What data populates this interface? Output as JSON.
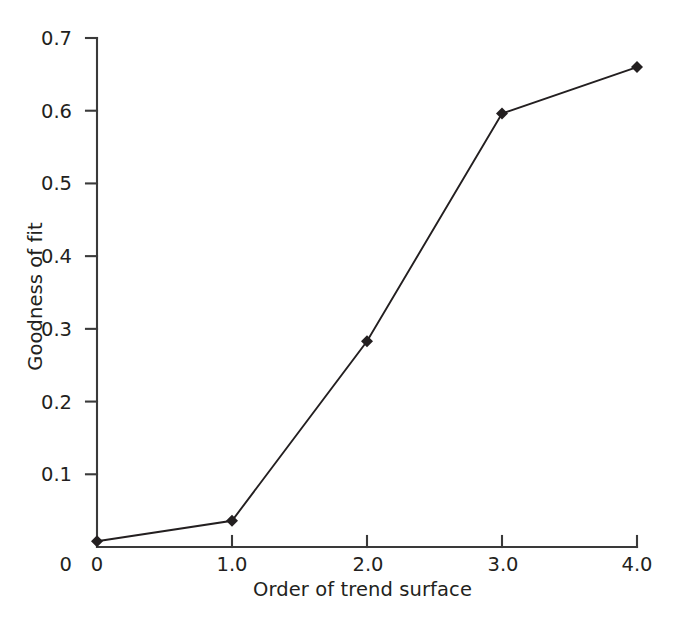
{
  "chart_data": {
    "type": "line",
    "title": "",
    "xlabel": "Order of trend surface",
    "ylabel": "Goodness of fit",
    "x": [
      0,
      1.0,
      2.0,
      3.0,
      4.0
    ],
    "values": [
      0.008,
      0.036,
      0.283,
      0.596,
      0.66
    ],
    "series": [
      {
        "name": "Goodness of fit",
        "x": [
          0,
          1.0,
          2.0,
          3.0,
          4.0
        ],
        "values": [
          0.008,
          0.036,
          0.283,
          0.596,
          0.66
        ]
      }
    ],
    "xlim": [
      0,
      4.0
    ],
    "ylim": [
      0,
      0.7
    ],
    "xticks": [
      0,
      1.0,
      2.0,
      3.0,
      4.0
    ],
    "yticks": [
      0,
      0.1,
      0.2,
      0.3,
      0.4,
      0.5,
      0.6,
      0.7
    ],
    "xticklabels": [
      "0",
      "1.0",
      "2.0",
      "3.0",
      "4.0"
    ],
    "yticklabels": [
      "0",
      "0.1",
      "0.2",
      "0.3",
      "0.4",
      "0.5",
      "0.6",
      "0.7"
    ],
    "grid": false,
    "legend": null,
    "marker": "diamond",
    "line_color": "#231f20",
    "marker_color": "#231f20",
    "background_color": "#ffffff"
  },
  "axes": {
    "x_title": "Order of trend surface",
    "y_title": "Goodness of fit",
    "y_ticks": [
      {
        "label": "0.7",
        "value": 0.7
      },
      {
        "label": "0.6",
        "value": 0.6
      },
      {
        "label": "0.5",
        "value": 0.5
      },
      {
        "label": "0.4",
        "value": 0.4
      },
      {
        "label": "0.3",
        "value": 0.3
      },
      {
        "label": "0.2",
        "value": 0.2
      },
      {
        "label": "0.1",
        "value": 0.1
      },
      {
        "label": "0",
        "value": 0
      }
    ],
    "x_ticks": [
      {
        "label": "0",
        "value": 0
      },
      {
        "label": "1.0",
        "value": 1.0
      },
      {
        "label": "2.0",
        "value": 2.0
      },
      {
        "label": "3.0",
        "value": 3.0
      },
      {
        "label": "4.0",
        "value": 4.0
      }
    ]
  }
}
